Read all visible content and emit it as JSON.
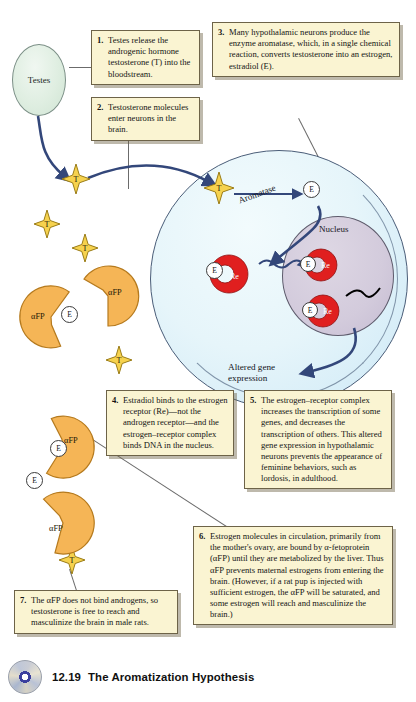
{
  "figure": {
    "caption_number": "12.19",
    "caption_title": "The Aromatization Hypothesis"
  },
  "labels": {
    "testes": "Testes",
    "nucleus": "Nucleus",
    "aromatase": "Aromatase",
    "altered_gene_line1": "Altered gene",
    "altered_gene_line2": "expression",
    "testosterone_symbol": "T",
    "estradiol_symbol": "E",
    "receptor_symbol": "Re",
    "afp_symbol": "αFP"
  },
  "steps": [
    {
      "number": "1.",
      "text": "Testes release the androgenic hormone testosterone (T) into the bloodstream."
    },
    {
      "number": "2.",
      "text": "Testosterone molecules enter neurons in the brain."
    },
    {
      "number": "3.",
      "text": "Many hypothalamic neurons produce the enzyme aromatase, which, in a single chemical reaction, converts testosterone into an estrogen, estradiol (E)."
    },
    {
      "number": "4.",
      "text": "Estradiol binds to the estrogen receptor (Re)—not the androgen receptor—and the estrogen–receptor complex binds DNA in the nucleus."
    },
    {
      "number": "5.",
      "text": "The estrogen–receptor complex increases the transcription of some genes, and decreases the transcription of others. This altered gene expression in hypothalamic neurons prevents the appearance of feminine behaviors, such as lordosis, in adulthood."
    },
    {
      "number": "6.",
      "text": "Estrogen molecules in circulation, primarily from the mother's ovary, are bound by α-fetoprotein (αFP) until they are metabolized by the liver. Thus αFP prevents maternal estrogens from entering the brain. (However, if a rat pup is injected with sufficient estrogen, the αFP will be saturated, and some estrogen will reach and masculinize the brain.)"
    },
    {
      "number": "7.",
      "text": "The αFP does not bind androgens, so testosterone is free to reach and masculinize the brain in male rats."
    }
  ],
  "colors": {
    "callout_bg": "#faf4d2",
    "testosterone": "#f6d24e",
    "afp": "#f5b556",
    "receptor": "#e01f1f",
    "cell": "#e6f5fa",
    "nucleus": "#d3cbdc",
    "testes": "#dfeee1",
    "arrow": "#33477a"
  }
}
